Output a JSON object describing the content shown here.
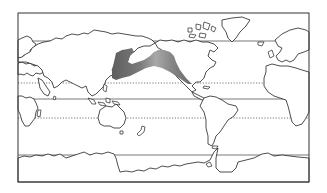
{
  "map": {
    "projection": "pacific-centered world map",
    "frame": {
      "x": 18,
      "y": 13,
      "width": 291,
      "height": 169
    },
    "colors": {
      "background": "#ffffff",
      "land_fill": "#ffffff",
      "coastline": "#222222",
      "range_fill": "#6e6e6e",
      "range_fade": "#9a9a9a",
      "latitude_line": "#555555"
    },
    "latitude_lines": [
      {
        "name": "arctic-circle",
        "y": 41,
        "style": "solid"
      },
      {
        "name": "tropic-of-cancer",
        "y": 83,
        "style": "dotted"
      },
      {
        "name": "equator",
        "y": 99,
        "style": "solid"
      },
      {
        "name": "tropic-of-capricorn",
        "y": 118,
        "style": "dotted"
      },
      {
        "name": "antarctic-circle",
        "y": 155,
        "style": "solid"
      }
    ],
    "shaded_region": {
      "description": "North Pacific distribution range from Japan / Sea of Okhotsk across to Alaska and the west coast of North America",
      "labels": []
    }
  }
}
